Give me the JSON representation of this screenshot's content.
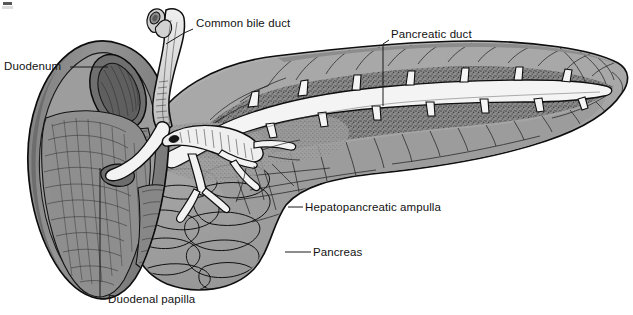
{
  "figure": {
    "background_color": "#ffffff",
    "width": 633,
    "height": 315,
    "corner_artifact": true
  },
  "palette": {
    "ink": "#101010",
    "label_text": "#121212",
    "duodenum_wall": "#8d8d8d",
    "duodenum_wall_dark": "#6f6f6f",
    "duodenum_lumen": "#7a7a7a",
    "duodenum_mucosa": "#9a9a9a",
    "pancreas_lobule": "#a3a3a3",
    "pancreas_lobule_light": "#b2b2b2",
    "pancreas_stipple": "#6e6e6e",
    "duct_lumen": "#f2f2f2",
    "duct_wall": "#d8d8d8",
    "bile_duct_fill": "#d5d5d5"
  },
  "labels": [
    {
      "id": "common-bile-duct",
      "text": "Common bile duct",
      "text_x": 196,
      "text_y": 27,
      "anchor": "start",
      "leader": "M 193 29 L 184 33 L 166 44"
    },
    {
      "id": "pancreatic-duct",
      "text": "Pancreatic duct",
      "text_x": 391,
      "text_y": 38,
      "anchor": "start",
      "leader": "M 389 40 L 383 44 L 383 106"
    },
    {
      "id": "duodenum",
      "text": "Duodenum",
      "text_x": 4,
      "text_y": 70,
      "anchor": "start",
      "leader": "M 70 67 L 108 67"
    },
    {
      "id": "hepatopancreatic-ampulla",
      "text": "Hepatopancreatic ampulla",
      "text_x": 305,
      "text_y": 211,
      "anchor": "start",
      "leader": "M 303 207 L 288 207"
    },
    {
      "id": "pancreas",
      "text": "Pancreas",
      "text_x": 313,
      "text_y": 256,
      "anchor": "start",
      "leader": "M 311 252 L 285 252"
    },
    {
      "id": "duodenal-papilla",
      "text": "Duodenal papilla",
      "text_x": 108,
      "text_y": 303,
      "anchor": "start",
      "leader": "M 106 299 L 100 299 L 100 168"
    }
  ]
}
